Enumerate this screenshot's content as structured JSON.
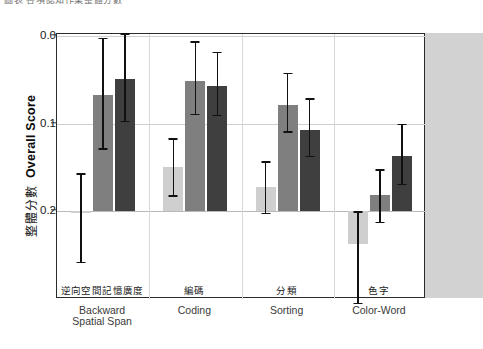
{
  "header": {
    "cut_off_text": "圖表  各項認知作業整體分數"
  },
  "axis": {
    "y_title_cn": "整體分數",
    "y_title_en": "Overall Score",
    "y_ticks": [
      "0.2",
      "0.1",
      "0.0"
    ]
  },
  "chart_data": {
    "type": "bar",
    "title": "",
    "xlabel": "",
    "ylabel": "Overall Score",
    "ylim": [
      -0.06,
      0.215
    ],
    "yticks": [
      0.0,
      0.1,
      0.2
    ],
    "grid": true,
    "legend_position": "none",
    "categories": [
      "Backward Spatial Span",
      "Coding",
      "Sorting",
      "Color-Word"
    ],
    "categories_cn": [
      "逆向空間記憶廣度",
      "編碼",
      "分類",
      "色字"
    ],
    "series": [
      {
        "name": "series-1",
        "color": "#cfcfcf",
        "values": [
          -0.001,
          0.05,
          0.027,
          -0.038
        ],
        "err_low": [
          -0.058,
          0.018,
          -0.002,
          -0.105
        ],
        "err_high": [
          0.043,
          0.083,
          0.057,
          0.0
        ]
      },
      {
        "name": "series-2",
        "color": "#7f7f7f",
        "values": [
          0.133,
          0.149,
          0.121,
          0.018
        ],
        "err_low": [
          0.072,
          0.111,
          0.091,
          -0.012
        ],
        "err_high": [
          0.198,
          0.194,
          0.158,
          0.048
        ]
      },
      {
        "name": "series-3",
        "color": "#3f3f3f",
        "values": [
          0.151,
          0.143,
          0.093,
          0.063
        ],
        "err_low": [
          0.103,
          0.11,
          0.063,
          0.031
        ],
        "err_high": [
          0.203,
          0.182,
          0.129,
          0.1
        ]
      }
    ]
  },
  "colors": {
    "series_light": "#cfcfcf",
    "series_mid": "#7f7f7f",
    "series_dark": "#3f3f3f",
    "frame": "#2b2b2b",
    "grid": "#cfcfcf",
    "right_panel": "#d2d2d2"
  }
}
